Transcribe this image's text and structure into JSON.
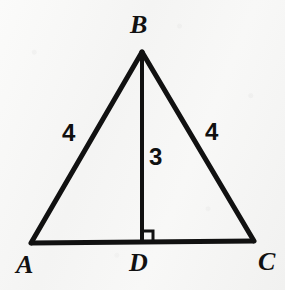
{
  "figure": {
    "kind": "geometry-diagram",
    "shape": "isosceles-triangle-with-altitude",
    "background_color": "#f7f7f6",
    "stroke_color": "#111111",
    "width": 285,
    "height": 290
  },
  "vertices": {
    "a": {
      "label": "A",
      "x": 31,
      "y": 243,
      "label_x": 16,
      "label_y": 252
    },
    "b": {
      "label": "B",
      "x": 142,
      "y": 52,
      "label_x": 130,
      "label_y": 12
    },
    "c": {
      "label": "C",
      "x": 254,
      "y": 241,
      "label_x": 258,
      "label_y": 249
    },
    "d": {
      "label": "D",
      "x": 142,
      "y": 242,
      "label_x": 129,
      "label_y": 250
    }
  },
  "segments": {
    "base_ac": {
      "name": "AC",
      "x1": 31,
      "y1": 243,
      "x2": 254,
      "y2": 241,
      "stroke_width": 5
    },
    "left_ab": {
      "name": "AB",
      "x1": 31,
      "y1": 243,
      "x2": 142,
      "y2": 52,
      "stroke_width": 5
    },
    "right_bc": {
      "name": "BC",
      "x1": 142,
      "y1": 52,
      "x2": 254,
      "y2": 241,
      "stroke_width": 5
    },
    "altitude_bd": {
      "name": "BD",
      "x1": 142,
      "y1": 52,
      "x2": 142,
      "y2": 242,
      "stroke_width": 4
    }
  },
  "measures": [
    {
      "key": "ab_length",
      "text": "4",
      "x": 62,
      "y": 121,
      "segment": "AB"
    },
    {
      "key": "bc_length",
      "text": "4",
      "x": 205,
      "y": 120,
      "segment": "BC"
    },
    {
      "key": "bd_height",
      "text": "3",
      "x": 149,
      "y": 145,
      "segment": "BD"
    }
  ],
  "right_angle_marker": {
    "at_vertex": "D",
    "x": 142,
    "y": 230,
    "size": 11,
    "stroke_width": 3
  }
}
